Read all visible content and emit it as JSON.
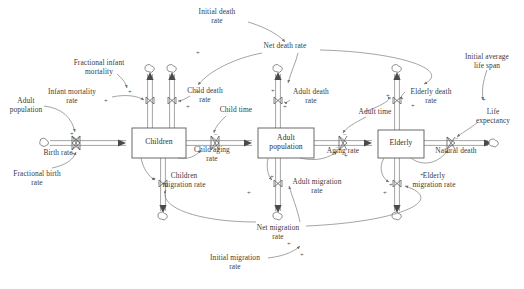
{
  "diagram": {
    "type": "system-dynamics-stock-flow",
    "colors": {
      "line": "#6f6f6f",
      "pipe": "#9a9a9a",
      "box_stroke": "#5a5a5a",
      "text": "#3a3a3a",
      "background": "#ffffff"
    },
    "stocks": [
      {
        "id": "children",
        "label": "Children",
        "x": 132,
        "y": 128,
        "w": 54,
        "h": 30
      },
      {
        "id": "adult_population",
        "label": "Adult\npopulation",
        "x": 258,
        "y": 128,
        "w": 56,
        "h": 30
      },
      {
        "id": "elderly",
        "label": "Elderly",
        "x": 378,
        "y": 130,
        "w": 46,
        "h": 28
      }
    ],
    "flows": [
      {
        "id": "birth_rate",
        "label": "Birth rate",
        "lx": 58,
        "ly": 149,
        "vx": 76,
        "vy": 140
      },
      {
        "id": "infant_mortality_rate",
        "label": "Infant mortality\nrate",
        "lx": 72,
        "ly": 92,
        "vx": 150,
        "vy": 101
      },
      {
        "id": "child_death_rate",
        "label": "Child death\nrate",
        "lx": 181,
        "ly": 91,
        "vx": 172,
        "vy": 101
      },
      {
        "id": "children_migration_rate",
        "label": "Children\nmigration rate",
        "lx": 149,
        "ly": 176,
        "vx": 163,
        "vy": 184
      },
      {
        "id": "child_aging_rate",
        "label": "Child aging\nrate",
        "lx": 199,
        "ly": 147,
        "vx": 215,
        "vy": 140
      },
      {
        "id": "adult_death_rate",
        "label": "Adult death\nrate",
        "lx": 297,
        "ly": 90,
        "vx": 278,
        "vy": 101
      },
      {
        "id": "adult_migration_rate",
        "label": "Adult migration\nrate",
        "lx": 293,
        "ly": 173,
        "vx": 278,
        "vy": 184
      },
      {
        "id": "aging_rate",
        "label": "Aging rate",
        "lx": 330,
        "ly": 147,
        "vx": 343,
        "vy": 140
      },
      {
        "id": "elderly_death_rate",
        "label": "Elderly death\nrate",
        "lx": 423,
        "ly": 90,
        "vx": 397,
        "vy": 101
      },
      {
        "id": "elderly_migration_rate",
        "label": "Elderly\nmigration rate",
        "lx": 423,
        "ly": 176,
        "vx": 397,
        "vy": 184
      },
      {
        "id": "natural_death",
        "label": "Natural death",
        "lx": 455,
        "ly": 147,
        "vx": 451,
        "vy": 142
      }
    ],
    "auxiliaries": [
      {
        "id": "adult_population_aux",
        "label": "Adult\npopulation",
        "lx": 22,
        "ly": 101
      },
      {
        "id": "fractional_birth_rate",
        "label": "Fractional birth\nrate",
        "lx": 32,
        "ly": 174
      },
      {
        "id": "fractional_infant_mortality",
        "label": "Fractional infant\nmortality",
        "lx": 99,
        "ly": 63
      },
      {
        "id": "initial_death_rate",
        "label": "Initial death\nrate",
        "lx": 217,
        "ly": 12
      },
      {
        "id": "net_death_rate",
        "label": "Net death rate",
        "lx": 285,
        "ly": 46
      },
      {
        "id": "child_time",
        "label": "Child time",
        "lx": 236,
        "ly": 110
      },
      {
        "id": "adult_time",
        "label": "Adult time",
        "lx": 375,
        "ly": 112
      },
      {
        "id": "net_migration_rate",
        "label": "Net migration\nrate",
        "lx": 278,
        "ly": 228
      },
      {
        "id": "initial_migration_rate",
        "label": "Initial migration\nrate",
        "lx": 235,
        "ly": 258
      },
      {
        "id": "initial_average_life_span",
        "label": "Initial average\nlife span",
        "lx": 487,
        "ly": 57
      },
      {
        "id": "life_expectancy",
        "label": "Life\nexpectancy",
        "lx": 494,
        "ly": 112
      }
    ],
    "clouds": [
      {
        "id": "source-birth",
        "x": 45,
        "y": 140
      },
      {
        "id": "sink-infant-mortality",
        "x": 150,
        "y": 67
      },
      {
        "id": "sink-child-death",
        "x": 172,
        "y": 67
      },
      {
        "id": "sink-children-migration",
        "x": 163,
        "y": 216
      },
      {
        "id": "sink-adult-death",
        "x": 278,
        "y": 67
      },
      {
        "id": "sink-adult-migration",
        "x": 278,
        "y": 216
      },
      {
        "id": "sink-elderly-death",
        "x": 397,
        "y": 67
      },
      {
        "id": "sink-elderly-migration",
        "x": 397,
        "y": 216
      },
      {
        "id": "sink-natural-death",
        "x": 494,
        "y": 142
      }
    ],
    "polarity_marks": [
      {
        "sign": "+",
        "x": 70,
        "y": 131
      },
      {
        "sign": "+",
        "x": 71,
        "y": 151
      },
      {
        "sign": "+",
        "x": 104,
        "y": 98
      },
      {
        "sign": "+",
        "x": 128,
        "y": 89
      },
      {
        "sign": "+",
        "x": 152,
        "y": 176
      },
      {
        "sign": "−",
        "x": 214,
        "y": 132
      },
      {
        "sign": "+",
        "x": 196,
        "y": 89
      },
      {
        "sign": "+",
        "x": 186,
        "y": 104
      },
      {
        "sign": "+",
        "x": 196,
        "y": 50
      },
      {
        "sign": "+",
        "x": 271,
        "y": 88
      },
      {
        "sign": "+",
        "x": 283,
        "y": 104
      },
      {
        "sign": "+",
        "x": 270,
        "y": 174
      },
      {
        "sign": "+",
        "x": 247,
        "y": 190
      },
      {
        "sign": "+",
        "x": 344,
        "y": 153
      },
      {
        "sign": "−",
        "x": 343,
        "y": 132
      },
      {
        "sign": "+",
        "x": 386,
        "y": 93
      },
      {
        "sign": "+",
        "x": 411,
        "y": 103
      },
      {
        "sign": "+",
        "x": 383,
        "y": 190
      },
      {
        "sign": "+",
        "x": 389,
        "y": 182
      },
      {
        "sign": "−",
        "x": 455,
        "y": 136
      },
      {
        "sign": "+",
        "x": 482,
        "y": 97
      },
      {
        "sign": "+",
        "x": 420,
        "y": 172
      },
      {
        "sign": "+",
        "x": 287,
        "y": 241
      },
      {
        "sign": "+",
        "x": 300,
        "y": 252
      }
    ]
  }
}
